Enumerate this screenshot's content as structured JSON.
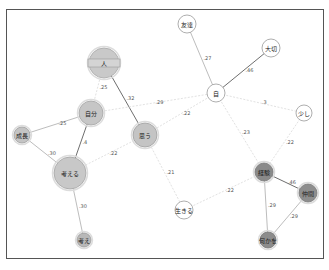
{
  "graph": {
    "type": "co-occurrence network",
    "nodes": [
      {
        "id": "hito",
        "label": "人",
        "x": 104,
        "y": 63,
        "r": 15,
        "fill": "#c9c9c9",
        "stroke": "#a8a8a8",
        "style": "bar"
      },
      {
        "id": "jibun",
        "label": "自分",
        "x": 91,
        "y": 113,
        "r": 12,
        "fill": "#c6c6c6",
        "stroke": "#a5a5a5"
      },
      {
        "id": "omou",
        "label": "思う",
        "x": 145,
        "y": 135,
        "r": 12,
        "fill": "#c4c4c4",
        "stroke": "#a0a0a0"
      },
      {
        "id": "seicho",
        "label": "成長",
        "x": 22,
        "y": 135,
        "r": 8,
        "fill": "#c4c4c4",
        "stroke": "#a0a0a0"
      },
      {
        "id": "kangaeru",
        "label": "考える",
        "x": 70,
        "y": 173,
        "r": 16,
        "fill": "#c8c8c8",
        "stroke": "#a5a5a5"
      },
      {
        "id": "kangae",
        "label": "考え",
        "x": 84,
        "y": 240,
        "r": 7,
        "fill": "#b8b8b8",
        "stroke": "#999"
      },
      {
        "id": "tomodachi",
        "label": "友達",
        "x": 187,
        "y": 24,
        "r": 9,
        "fill": "#ffffff",
        "stroke": "#999"
      },
      {
        "id": "taisetsu",
        "label": "大切",
        "x": 271,
        "y": 48,
        "r": 9,
        "fill": "#ffffff",
        "stroke": "#999"
      },
      {
        "id": "ji",
        "label": "自",
        "x": 216,
        "y": 93,
        "r": 9,
        "fill": "#ffffff",
        "stroke": "#999"
      },
      {
        "id": "sukoshi",
        "label": "少し",
        "x": 304,
        "y": 113,
        "r": 8,
        "fill": "#ffffff",
        "stroke": "#999"
      },
      {
        "id": "ikiru",
        "label": "生きる",
        "x": 184,
        "y": 210,
        "r": 9,
        "fill": "#ffffff",
        "stroke": "#999"
      },
      {
        "id": "keiken",
        "label": "経験",
        "x": 264,
        "y": 172,
        "r": 9,
        "fill": "#8a8a8a",
        "stroke": "#777"
      },
      {
        "id": "nakama",
        "label": "仲間",
        "x": 308,
        "y": 193,
        "r": 9,
        "fill": "#8e8e8e",
        "stroke": "#777"
      },
      {
        "id": "nanika",
        "label": "何かを",
        "x": 268,
        "y": 240,
        "r": 8,
        "fill": "#8c8c8c",
        "stroke": "#777"
      }
    ],
    "edges": [
      {
        "from": "hito",
        "to": "jibun",
        "weight": ".25",
        "style": "dashed"
      },
      {
        "from": "hito",
        "to": "omou",
        "weight": ".32",
        "style": "solid-dark"
      },
      {
        "from": "jibun",
        "to": "ji",
        "weight": ".29",
        "style": "dashed"
      },
      {
        "from": "jibun",
        "to": "seicho",
        "weight": ".25",
        "style": "solid"
      },
      {
        "from": "jibun",
        "to": "kangaeru",
        "weight": ".4",
        "style": "solid-dark"
      },
      {
        "from": "seicho",
        "to": "kangaeru",
        "weight": ".30",
        "style": "solid"
      },
      {
        "from": "kangaeru",
        "to": "omou",
        "weight": ".22",
        "style": "dashed"
      },
      {
        "from": "kangaeru",
        "to": "kangae",
        "weight": ".30",
        "style": "solid"
      },
      {
        "from": "omou",
        "to": "ji",
        "weight": ".22",
        "style": "dashed"
      },
      {
        "from": "omou",
        "to": "ikiru",
        "weight": ".21",
        "style": "dashed"
      },
      {
        "from": "tomodachi",
        "to": "ji",
        "weight": ".27",
        "style": "solid"
      },
      {
        "from": "taisetsu",
        "to": "ji",
        "weight": ".46",
        "style": "solid-dark"
      },
      {
        "from": "ji",
        "to": "sukoshi",
        "weight": ".3",
        "style": "dashed"
      },
      {
        "from": "ji",
        "to": "keiken",
        "weight": ".23",
        "style": "dashed"
      },
      {
        "from": "sukoshi",
        "to": "keiken",
        "weight": ".22",
        "style": "dashed"
      },
      {
        "from": "ikiru",
        "to": "keiken",
        "weight": ".22",
        "style": "dashed"
      },
      {
        "from": "keiken",
        "to": "nakama",
        "weight": ".46",
        "style": "solid-dark"
      },
      {
        "from": "keiken",
        "to": "nanika",
        "weight": ".29",
        "style": "solid"
      },
      {
        "from": "nakama",
        "to": "nanika",
        "weight": ".29",
        "style": "solid"
      }
    ]
  }
}
